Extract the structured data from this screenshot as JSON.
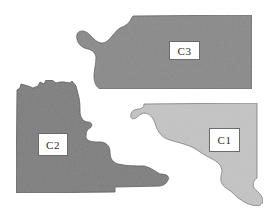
{
  "diagram": {
    "regions": [
      {
        "id": "C3",
        "label": "C3",
        "fill": "#8a8a8a",
        "stroke": "#5e5e5e"
      },
      {
        "id": "C2",
        "label": "C2",
        "fill": "#7f7f7f",
        "stroke": "#555555"
      },
      {
        "id": "C1",
        "label": "C1",
        "fill": "#c4c4c4",
        "stroke": "#7a7a7a"
      }
    ]
  }
}
